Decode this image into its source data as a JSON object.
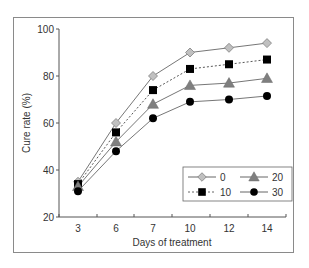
{
  "chart_data": {
    "type": "line",
    "title": "",
    "xlabel": "Days of treatment",
    "ylabel": "Cure rate (%)",
    "categories": [
      "3",
      "6",
      "7",
      "10",
      "12",
      "14"
    ],
    "ylim": [
      20,
      100
    ],
    "yticks": [
      20,
      40,
      60,
      80,
      100
    ],
    "grid": false,
    "legend_position": "lower right (inside plot, 2 columns)",
    "series": [
      {
        "name": "0",
        "marker": "diamond",
        "color": "#b8b8b8",
        "line": "solid",
        "values": [
          35,
          60,
          80,
          90,
          92,
          94
        ]
      },
      {
        "name": "10",
        "marker": "square",
        "color": "#000000",
        "line": "dashed",
        "values": [
          34,
          56,
          74,
          83,
          85,
          87
        ]
      },
      {
        "name": "20",
        "marker": "triangle",
        "color": "#7f7f7f",
        "line": "solid",
        "values": [
          33,
          52,
          68,
          76,
          77,
          79
        ]
      },
      {
        "name": "30",
        "marker": "circle",
        "color": "#000000",
        "line": "solid",
        "values": [
          31,
          48,
          62,
          69,
          70,
          71.5
        ]
      }
    ]
  },
  "axes": {
    "x_title": "Days of treatment",
    "y_title": "Cure rate (%)",
    "x_ticks": [
      "3",
      "6",
      "7",
      "10",
      "12",
      "14"
    ],
    "y_ticks": [
      "20",
      "40",
      "60",
      "80",
      "100"
    ]
  },
  "legend": {
    "items": [
      {
        "label": "0",
        "marker": "diamond"
      },
      {
        "label": "20",
        "marker": "triangle"
      },
      {
        "label": "10",
        "marker": "square"
      },
      {
        "label": "30",
        "marker": "circle"
      }
    ]
  }
}
